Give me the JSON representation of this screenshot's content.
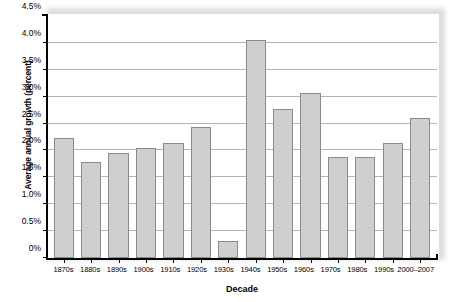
{
  "chart_data": {
    "type": "bar",
    "title": "",
    "xlabel": "Decade",
    "ylabel": "Average annual growth (percent)",
    "categories": [
      "1870s",
      "1880s",
      "1890s",
      "1900s",
      "1910s",
      "1920s",
      "1930s",
      "1940s",
      "1950s",
      "1960s",
      "1970s",
      "1980s",
      "1990s",
      "2000–2007"
    ],
    "values": [
      2.23,
      1.78,
      1.95,
      2.05,
      2.13,
      2.43,
      0.32,
      4.05,
      2.78,
      3.07,
      1.88,
      1.88,
      2.13,
      2.6
    ],
    "ylim": [
      0,
      4.5
    ],
    "ytick_values": [
      0,
      0.5,
      1.0,
      1.5,
      2.0,
      2.5,
      3.0,
      3.5,
      4.0,
      4.5
    ],
    "ytick_labels": [
      "0%",
      "0.5%",
      "1.0%",
      "1.5%",
      "2.0%",
      "2.5%",
      "3.0%",
      "3.5%",
      "4.0%",
      "4.5%"
    ],
    "grid": true,
    "legend": null,
    "bar_color": "#cfcfcf",
    "bar_border_color": "#8a8a8a",
    "gridline_color": "#b4b4b4",
    "axis_color": "#000000"
  }
}
